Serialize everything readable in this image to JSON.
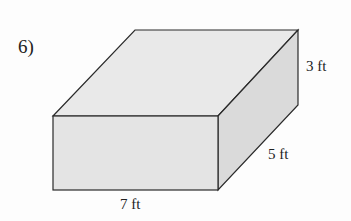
{
  "problem_number": "6)",
  "shape": "rectangular-prism",
  "dimensions": {
    "height": "3 ft",
    "depth": "5 ft",
    "length": "7 ft"
  },
  "colors": {
    "front": "#e4e4e4",
    "top": "#e9e9e9",
    "side": "#dadada",
    "edge": "#2a2a2a"
  }
}
